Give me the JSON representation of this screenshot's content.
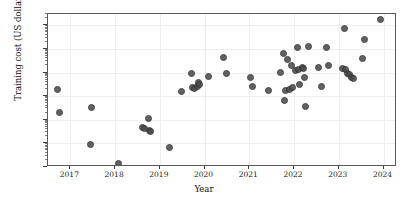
{
  "chart_data": {
    "type": "scatter",
    "title": "",
    "xlabel": "Year",
    "ylabel": "Training cost (US dollars)",
    "xlim": [
      2016.5,
      2024.3
    ],
    "ylim": [
      100,
      300000000
    ],
    "yscale": "log",
    "xscale": "linear",
    "grid": true,
    "legend": null,
    "xticks": [
      2017,
      2018,
      2019,
      2020,
      2021,
      2022,
      2023,
      2024
    ],
    "xtick_labels": [
      "2017",
      "2018",
      "2019",
      "2020",
      "2021",
      "2022",
      "2023",
      "2024"
    ],
    "yticks": [
      100,
      1000,
      10000,
      100000,
      1000000,
      10000000,
      100000000
    ],
    "ytick_labels": [
      "10^2",
      "10^3",
      "10^4",
      "10^5",
      "10^6",
      "10^7",
      "10^8"
    ],
    "ytick_bases": [
      "10",
      "10",
      "10",
      "10",
      "10",
      "10",
      "10"
    ],
    "ytick_exponents": [
      "2",
      "3",
      "4",
      "5",
      "6",
      "7",
      "8"
    ],
    "marker": {
      "shape": "circle",
      "color": "#4d4d4d",
      "edge_color": "#2f2f2f",
      "size_px": 7,
      "opacity": 0.88
    },
    "n_points": 57,
    "points": [
      {
        "x": 2016.72,
        "y": 190000
      },
      {
        "x": 2016.75,
        "y": 20000
      },
      {
        "x": 2017.48,
        "y": 33000
      },
      {
        "x": 2017.45,
        "y": 920
      },
      {
        "x": 2018.08,
        "y": 140
      },
      {
        "x": 2018.62,
        "y": 4600
      },
      {
        "x": 2018.66,
        "y": 4300
      },
      {
        "x": 2018.74,
        "y": 11500
      },
      {
        "x": 2018.76,
        "y": 3600
      },
      {
        "x": 2018.78,
        "y": 3200
      },
      {
        "x": 2019.22,
        "y": 660
      },
      {
        "x": 2019.49,
        "y": 160000
      },
      {
        "x": 2019.7,
        "y": 890000
      },
      {
        "x": 2019.72,
        "y": 230000
      },
      {
        "x": 2019.78,
        "y": 210000
      },
      {
        "x": 2019.84,
        "y": 250000
      },
      {
        "x": 2019.86,
        "y": 390000
      },
      {
        "x": 2019.88,
        "y": 320000
      },
      {
        "x": 2020.08,
        "y": 700000
      },
      {
        "x": 2020.43,
        "y": 4200000
      },
      {
        "x": 2020.48,
        "y": 950000
      },
      {
        "x": 2021.03,
        "y": 610000
      },
      {
        "x": 2021.08,
        "y": 250000
      },
      {
        "x": 2021.42,
        "y": 175000
      },
      {
        "x": 2021.7,
        "y": 970000
      },
      {
        "x": 2021.77,
        "y": 6300000
      },
      {
        "x": 2021.78,
        "y": 68000
      },
      {
        "x": 2021.8,
        "y": 170000
      },
      {
        "x": 2021.86,
        "y": 3500000
      },
      {
        "x": 2021.9,
        "y": 200000
      },
      {
        "x": 2021.95,
        "y": 2000000
      },
      {
        "x": 2021.97,
        "y": 225000
      },
      {
        "x": 2022.03,
        "y": 1200000
      },
      {
        "x": 2022.07,
        "y": 11500000
      },
      {
        "x": 2022.1,
        "y": 1350000
      },
      {
        "x": 2022.12,
        "y": 300000
      },
      {
        "x": 2022.18,
        "y": 1600000
      },
      {
        "x": 2022.2,
        "y": 1500000
      },
      {
        "x": 2022.24,
        "y": 620000
      },
      {
        "x": 2022.26,
        "y": 36000
      },
      {
        "x": 2022.32,
        "y": 12500000
      },
      {
        "x": 2022.55,
        "y": 1700000
      },
      {
        "x": 2022.62,
        "y": 250000
      },
      {
        "x": 2022.72,
        "y": 11500000
      },
      {
        "x": 2022.78,
        "y": 1900000
      },
      {
        "x": 2023.08,
        "y": 1500000
      },
      {
        "x": 2023.12,
        "y": 73000000
      },
      {
        "x": 2023.16,
        "y": 1400000
      },
      {
        "x": 2023.2,
        "y": 900000
      },
      {
        "x": 2023.24,
        "y": 800000
      },
      {
        "x": 2023.28,
        "y": 620000
      },
      {
        "x": 2023.32,
        "y": 580000
      },
      {
        "x": 2023.52,
        "y": 4000000
      },
      {
        "x": 2023.58,
        "y": 24000000
      },
      {
        "x": 2023.92,
        "y": 180000000
      }
    ]
  }
}
